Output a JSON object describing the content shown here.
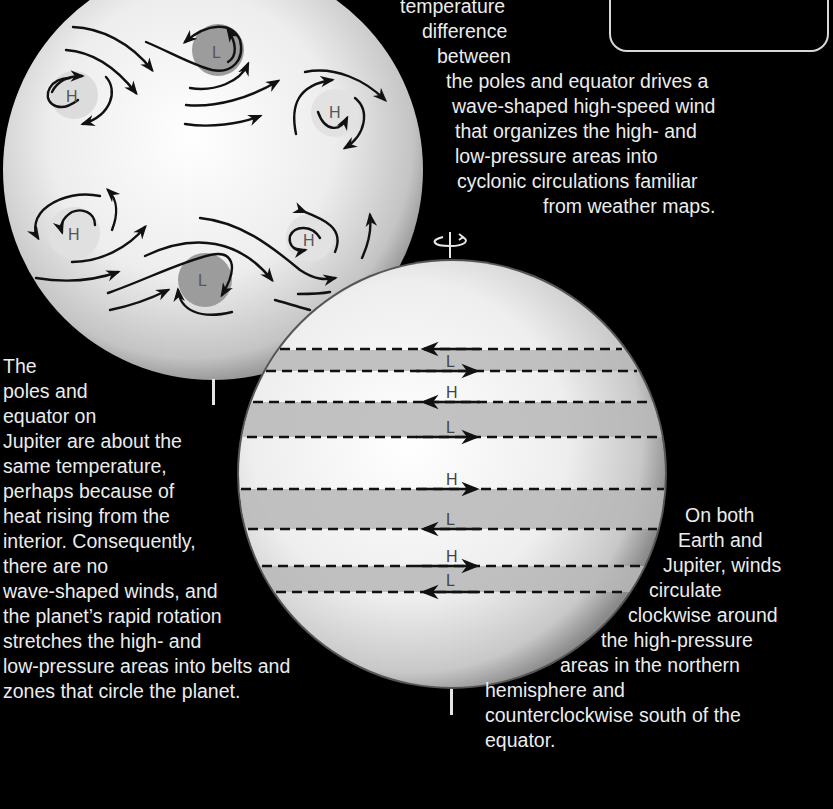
{
  "figure": {
    "earth": {
      "name": "Earth",
      "systems": [
        {
          "type": "H",
          "label": "H"
        },
        {
          "type": "L",
          "label": "L"
        },
        {
          "type": "H",
          "label": "H"
        },
        {
          "type": "H",
          "label": "H"
        },
        {
          "type": "L",
          "label": "L"
        },
        {
          "type": "H",
          "label": "H"
        }
      ]
    },
    "jupiter": {
      "name": "Jupiter",
      "bands": [
        {
          "label": "L",
          "top_arrow": "left",
          "bottom_arrow": "right"
        },
        {
          "label": "H",
          "arrow": "left"
        },
        {
          "label": "L",
          "arrow": "right"
        },
        {
          "label": "H",
          "arrow": "right"
        },
        {
          "label": "L",
          "arrow": "left"
        },
        {
          "label": "H",
          "arrow": "right"
        },
        {
          "label": "L",
          "arrow": "left"
        }
      ]
    },
    "rotation_axis_icon": "rotation-arrow-icon"
  },
  "captions": {
    "earth": [
      "temperature",
      "difference",
      "between",
      "the poles and equator drives a",
      "wave-shaped high-speed wind",
      "that organizes the high- and",
      "low-pressure areas into",
      "cyclonic circulations familiar",
      "from weather maps."
    ],
    "jupiter": [
      "The",
      "poles and",
      "equator on",
      "Jupiter are about the",
      "same temperature,",
      "perhaps because of",
      "heat rising from the",
      "interior. Consequently,",
      "there are no",
      "wave-shaped winds, and",
      "the planet’s rapid rotation",
      "stretches the high- and",
      "low-pressure areas into belts and",
      "zones that circle the planet."
    ],
    "both": [
      "On both",
      "Earth and",
      "Jupiter, winds",
      "circulate",
      "clockwise around",
      "the high-pressure",
      "areas in the northern",
      "hemisphere and",
      "counterclockwise south of the",
      "equator."
    ]
  },
  "colors": {
    "background": "#000000",
    "planet_light": "#f4f4f4",
    "planet_shade": "#8a8a8a",
    "band_gray": "#b5b5b5",
    "low_pressure_spot": "#9a9a9a",
    "text": "#ececec"
  }
}
